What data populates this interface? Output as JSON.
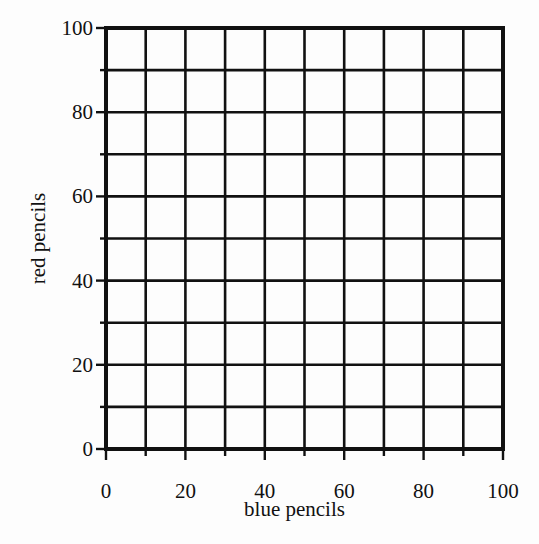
{
  "chart_data": {
    "type": "scatter",
    "title": "",
    "xlabel": "blue pencils",
    "ylabel": "red pencils",
    "xlim": [
      0,
      100
    ],
    "ylim": [
      0,
      100
    ],
    "x_ticks": [
      0,
      20,
      40,
      60,
      80,
      100
    ],
    "y_ticks": [
      0,
      20,
      40,
      60,
      80,
      100
    ],
    "x_minor_ticks": [
      10,
      30,
      50,
      70,
      90
    ],
    "y_minor_ticks": [
      10,
      30,
      50,
      70,
      90
    ],
    "grid": true,
    "grid_step": 10,
    "series": [],
    "legend": null,
    "colors": {
      "ink": "#111111",
      "background": "#fdfdfd"
    }
  },
  "layout": {
    "plot": {
      "left": 106,
      "top": 28,
      "right": 503,
      "bottom": 449
    }
  }
}
